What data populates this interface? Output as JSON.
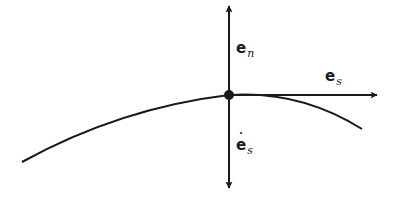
{
  "diagram": {
    "type": "vector-diagram",
    "colors": {
      "stroke": "#1a1a1a",
      "background": "#ffffff"
    },
    "point": {
      "x": 229,
      "y": 95
    },
    "curve": {
      "start": [
        22,
        162
      ],
      "control": [
        170,
        90
      ],
      "mid": [
        229,
        95
      ],
      "end": [
        362,
        129
      ]
    },
    "vectors": [
      {
        "id": "e_n",
        "direction": "up",
        "tip": [
          229,
          5
        ]
      },
      {
        "id": "e_s",
        "direction": "right",
        "tip": [
          377,
          95
        ]
      },
      {
        "id": "e_s_dot",
        "direction": "down",
        "tip": [
          229,
          189
        ]
      }
    ],
    "labels": {
      "e_n": {
        "base": "e",
        "subscript": "n"
      },
      "e_s": {
        "base": "e",
        "subscript": "s"
      },
      "e_s_dot": {
        "base": "e",
        "subscript": "s",
        "accent": "˙"
      }
    }
  }
}
